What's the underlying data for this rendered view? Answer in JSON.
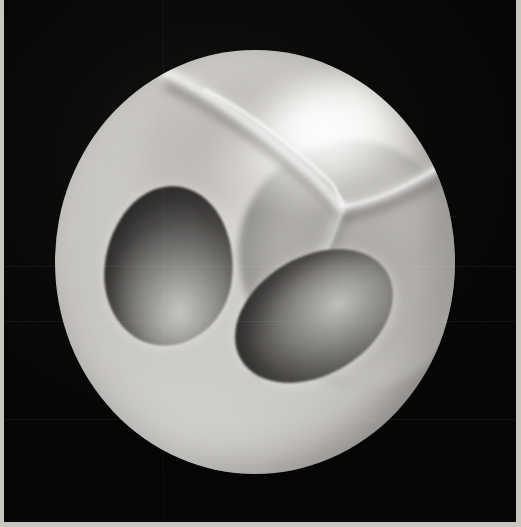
{
  "artwork": {
    "title": "Sphere with Y-ridge and three concave ovoid cavities",
    "medium": "Black-and-white photographic print",
    "orientation": "portrait",
    "caption": "",
    "background_color": "#050505",
    "paper_margin_color": "#c9c6c0"
  },
  "canvas": {
    "width": 521,
    "height": 527,
    "photo_field": {
      "left": 4,
      "top": 0,
      "width": 512,
      "height": 522
    }
  },
  "subject": {
    "name": "sphere",
    "center_x": 255,
    "center_y": 262,
    "radius_x": 200,
    "radius_y": 212,
    "base_tone": "#c2c0bb",
    "highlight_tone": "#ffffff",
    "shadow_tone": "#6d6b67",
    "rim_tone": "#8b8984"
  },
  "features": [
    {
      "id": "specular-highlight",
      "name": "specular-highlight",
      "description": "Bright diffuse highlight on the upper-right of the sphere",
      "center_x": 322,
      "center_y": 133,
      "tone": "#fbfaf8"
    },
    {
      "id": "ridge",
      "name": "y-shaped-ridge",
      "description": "Bright raised Y-shaped crease; junction forks into an upward-left arm, a rightward arm, and a long tail running down-left",
      "junction_x": 287,
      "junction_y": 157,
      "tone": "#efeeea"
    },
    {
      "id": "right-depression",
      "name": "broad-shallow-depression",
      "description": "Large soft mid-grey depression occupying the right half of the sphere",
      "center_x": 350,
      "center_y": 265,
      "tone": "#9a9894"
    },
    {
      "id": "cavity-left",
      "name": "left-ovoid-cavity",
      "description": "Egg-shaped concave cavity, dark at upper-left with a soft light pool at lower-centre",
      "center_x": 169,
      "center_y": 266,
      "width": 128,
      "height": 160,
      "rotation_deg": 6,
      "dark_tone": "#434140",
      "light_tone": "#c7c5c0"
    },
    {
      "id": "cavity-lower",
      "name": "lower-right-ovoid-cavity",
      "description": "Tilted elliptical concave cavity, dark at lower-left with a light pool at upper-right",
      "center_x": 314,
      "center_y": 316,
      "width": 170,
      "height": 118,
      "rotation_deg": -31,
      "dark_tone": "#464443",
      "light_tone": "#c0beb9"
    }
  ],
  "ridge_geometry": {
    "junction": [
      287,
      157
    ],
    "arm_up_left": "M 110 22 C 158 44, 214 86, 262 130 L 287 157",
    "arm_right": "M 287 157 C 320 152, 360 134, 402 106",
    "arm_tail": "M 287 157 C 272 196, 250 242, 222 288 C 213 302, 205 312, 200 318",
    "stroke_color": "#f2f1ee"
  },
  "seams": {
    "horizontal_y": [
      266,
      321,
      419
    ],
    "vertical_x": [
      163
    ]
  }
}
